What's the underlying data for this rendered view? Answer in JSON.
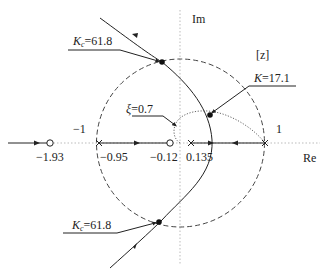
{
  "diagram": {
    "type": "root-locus-z-plane",
    "axes": {
      "real_label": "Re",
      "imag_label": "Im",
      "plane_label": "[z]"
    },
    "unit_circle": {
      "left_label": "−1",
      "right_label": "1"
    },
    "real_axis_points": [
      {
        "kind": "zero",
        "value": "−1.93"
      },
      {
        "kind": "pole",
        "value": "−0.95"
      },
      {
        "kind": "zero",
        "value": "−0.12"
      },
      {
        "kind": "pole",
        "value": "0.135"
      },
      {
        "kind": "pole",
        "value": "1"
      }
    ],
    "annotations": {
      "kc_top": {
        "symbol": "K",
        "sub": "c",
        "value": "=61.8"
      },
      "kc_bottom": {
        "symbol": "K",
        "sub": "c",
        "value": "=61.8"
      },
      "k_point": {
        "symbol": "K",
        "value": "=17.1"
      },
      "xi": {
        "symbol": "ξ",
        "value": "=0.7"
      }
    }
  }
}
